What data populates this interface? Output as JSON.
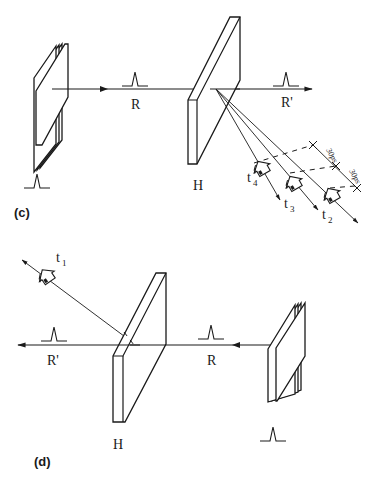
{
  "figure": {
    "panels": [
      {
        "id": "c",
        "label": "(c)",
        "beam_in_label": "R",
        "beam_out_label": "R'",
        "hologram_label": "H",
        "observers": [
          {
            "label": "t",
            "sub": "4"
          },
          {
            "label": "t",
            "sub": "3"
          },
          {
            "label": "t",
            "sub": "2"
          }
        ],
        "dimension_labels": [
          "30ps",
          "30ps"
        ]
      },
      {
        "id": "d",
        "label": "(d)",
        "beam_in_label": "R",
        "beam_out_label": "R'",
        "hologram_label": "H",
        "observers": [
          {
            "label": "t",
            "sub": "1"
          }
        ]
      }
    ]
  }
}
